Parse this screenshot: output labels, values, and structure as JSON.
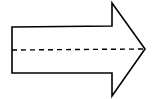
{
  "diagram": {
    "shape": "right-arrow",
    "direction": "right",
    "stroke_color": "#000000",
    "fill_color": "#ffffff",
    "centerline": {
      "style": "dashed",
      "color": "#000000"
    }
  }
}
